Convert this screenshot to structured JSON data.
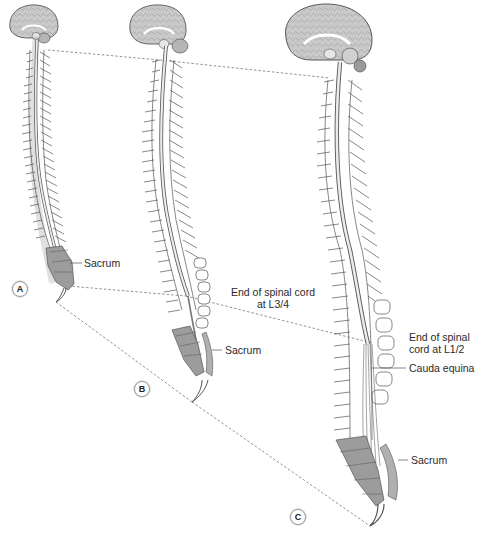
{
  "figure": {
    "stages": [
      {
        "id": "A",
        "label": "A"
      },
      {
        "id": "B",
        "label": "B"
      },
      {
        "id": "C",
        "label": "C"
      }
    ],
    "labels": {
      "a_sacrum": "Sacrum",
      "b_end_cord_line1": "End of spinal cord",
      "b_end_cord_line2": "at L3/4",
      "b_sacrum": "Sacrum",
      "c_end_cord_line1": "End of spinal",
      "c_end_cord_line2": "cord at L1/2",
      "c_cauda_equina": "Cauda equina",
      "c_sacrum": "Sacrum"
    },
    "colors": {
      "line": "#555555",
      "brain_fill": "#c9c9c9",
      "sacrum_fill": "#9c9c9c",
      "cord_fill": "#e8e8e8",
      "dashed": "#777777"
    }
  }
}
